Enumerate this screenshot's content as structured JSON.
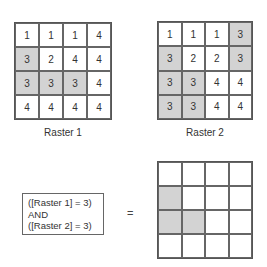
{
  "raster1": {
    "label": "Raster 1",
    "cells": [
      [
        "1",
        "1",
        "1",
        "4"
      ],
      [
        "3",
        "2",
        "4",
        "4"
      ],
      [
        "3",
        "3",
        "3",
        "4"
      ],
      [
        "4",
        "4",
        "4",
        "4"
      ]
    ],
    "highlight": [
      [
        0,
        0,
        0,
        0
      ],
      [
        1,
        0,
        0,
        0
      ],
      [
        1,
        1,
        1,
        0
      ],
      [
        0,
        0,
        0,
        0
      ]
    ]
  },
  "raster2": {
    "label": "Raster 2",
    "cells": [
      [
        "1",
        "1",
        "1",
        "3"
      ],
      [
        "3",
        "2",
        "2",
        "3"
      ],
      [
        "3",
        "3",
        "4",
        "4"
      ],
      [
        "3",
        "3",
        "4",
        "4"
      ]
    ],
    "highlight": [
      [
        0,
        0,
        0,
        1
      ],
      [
        1,
        0,
        0,
        1
      ],
      [
        1,
        1,
        0,
        0
      ],
      [
        1,
        1,
        0,
        0
      ]
    ]
  },
  "expression": {
    "line1": "([Raster 1] = 3)",
    "line2": "AND",
    "line3": "([Raster 2] = 3)"
  },
  "equals": "=",
  "result": {
    "cells": [
      [
        "",
        "",
        "",
        ""
      ],
      [
        "",
        "",
        "",
        ""
      ],
      [
        "",
        "",
        "",
        ""
      ],
      [
        "",
        "",
        "",
        ""
      ]
    ],
    "highlight": [
      [
        0,
        0,
        0,
        0
      ],
      [
        1,
        0,
        0,
        0
      ],
      [
        1,
        1,
        0,
        0
      ],
      [
        0,
        0,
        0,
        0
      ]
    ]
  },
  "colors": {
    "highlight": "#d3d3d3",
    "grid_line": "#555555"
  }
}
